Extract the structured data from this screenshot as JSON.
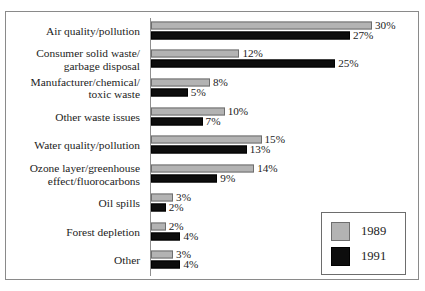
{
  "title_remnant": "Environmental Concerns",
  "legend": {
    "position": "bottom-right",
    "items": [
      {
        "label": "1989",
        "color": "#b3b3b3",
        "key": "y1989"
      },
      {
        "label": "1991",
        "color": "#0d0d0d",
        "key": "y1991"
      }
    ]
  },
  "chart_data": {
    "type": "bar",
    "orientation": "horizontal",
    "title": "",
    "xlabel": "",
    "ylabel": "",
    "grid": false,
    "legend_position": "bottom-right",
    "value_suffix": "%",
    "xlim": [
      0,
      30
    ],
    "categories": [
      "Air quality/pollution",
      "Consumer solid waste/\ngarbage disposal",
      "Manufacturer/chemical/\ntoxic waste",
      "Other waste issues",
      "Water quality/pollution",
      "Ozone layer/greenhouse\neffect/fluorocarbons",
      "Oil spills",
      "Forest depletion",
      "Other"
    ],
    "series": [
      {
        "name": "1989",
        "color": "#b3b3b3",
        "values": [
          30,
          12,
          8,
          10,
          15,
          14,
          3,
          2,
          3
        ],
        "labels": [
          "30%",
          "12%",
          "8%",
          "10%",
          "15%",
          "14%",
          "3%",
          "2%",
          "3%"
        ]
      },
      {
        "name": "1991",
        "color": "#0d0d0d",
        "values": [
          27,
          25,
          5,
          7,
          13,
          9,
          2,
          4,
          4
        ],
        "labels": [
          "27%",
          "25%",
          "5%",
          "7%",
          "13%",
          "9%",
          "2%",
          "4%",
          "4%"
        ]
      }
    ]
  }
}
